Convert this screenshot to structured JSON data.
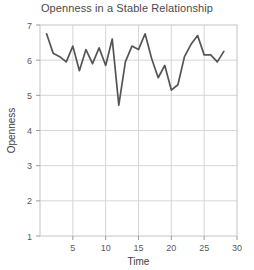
{
  "chart_data": {
    "type": "line",
    "title": "Openness in a Stable Relationship",
    "xlabel": "Time",
    "ylabel": "Openness",
    "xlim": [
      0,
      30
    ],
    "ylim": [
      1,
      7
    ],
    "xticks": [
      5,
      10,
      15,
      20,
      25,
      30
    ],
    "yticks": [
      1,
      2,
      3,
      4,
      5,
      6,
      7
    ],
    "grid": true,
    "legend": "none",
    "line_color": "#555555",
    "background_color": "#ffffff",
    "grid_color": "#d6d6d6",
    "x": [
      1,
      2,
      3,
      4,
      5,
      6,
      7,
      8,
      9,
      10,
      11,
      12,
      13,
      14,
      15,
      16,
      17,
      18,
      19,
      20,
      21,
      22,
      23,
      24,
      25,
      26,
      27,
      28
    ],
    "values": [
      6.75,
      6.2,
      6.1,
      5.95,
      6.4,
      5.7,
      6.3,
      5.9,
      6.35,
      5.85,
      6.6,
      4.72,
      5.95,
      6.4,
      6.3,
      6.75,
      6.05,
      5.5,
      5.85,
      5.15,
      5.3,
      6.1,
      6.45,
      6.7,
      6.15,
      6.15,
      5.95,
      6.25
    ],
    "series_name": "Openness"
  },
  "ticks": {
    "y7": "7",
    "y6": "6",
    "y5": "5",
    "y4": "4",
    "y3": "3",
    "y2": "2",
    "y1": "1",
    "x5": "5",
    "x10": "10",
    "x15": "15",
    "x20": "20",
    "x25": "25",
    "x30": "30"
  }
}
